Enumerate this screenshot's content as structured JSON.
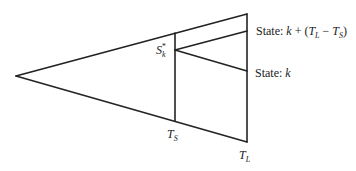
{
  "diagram": {
    "type": "branching-timeline-wedge",
    "line_color": "#222222",
    "background": "#ffffff",
    "nodes": {
      "apex": {
        "x": 16,
        "y": 76
      },
      "ts_top": {
        "x": 175,
        "y": 33
      },
      "ts_bottom": {
        "x": 175,
        "y": 121
      },
      "branch_point": {
        "x": 175,
        "y": 50
      },
      "tl_top": {
        "x": 247,
        "y": 14
      },
      "tl_bottom": {
        "x": 247,
        "y": 142
      },
      "state_upper": {
        "x": 247,
        "y": 31
      },
      "state_k": {
        "x": 247,
        "y": 71
      }
    },
    "labels": {
      "s_k_star": {
        "main": "S",
        "sub": "k",
        "sup": "*"
      },
      "t_s": {
        "main": "T",
        "sub": "S"
      },
      "t_l": {
        "main": "T",
        "sub": "L"
      },
      "state_upper": {
        "prefix": "State: ",
        "k": "k",
        "plus": " + (",
        "tl_main": "T",
        "tl_sub": "L",
        "minus": " − ",
        "ts_main": "T",
        "ts_sub": "S",
        "close": ")"
      },
      "state_k": {
        "prefix": "State: ",
        "k": "k"
      }
    }
  }
}
